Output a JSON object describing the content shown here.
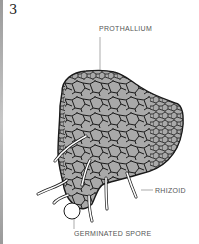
{
  "figure": {
    "number": "3",
    "labels": {
      "prothallium": "PROTHALLIUM",
      "rhizoid": "RHIZOID",
      "germinated_spore": "GERMINATED SPORE"
    },
    "colors": {
      "cell_fill": "#a9a9a9",
      "cell_wall": "#1a1a1a",
      "rhizoid": "#ffffff",
      "leader_line": "#888888"
    }
  }
}
